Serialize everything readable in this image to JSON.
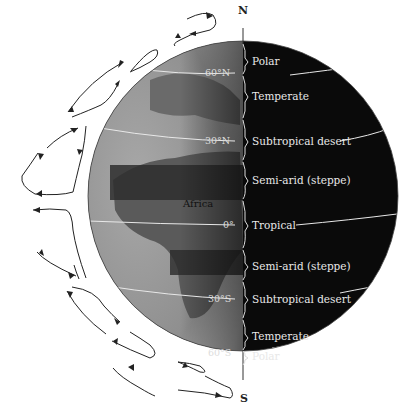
{
  "figure": {
    "poles": {
      "north": "N",
      "south": "S"
    },
    "continent_label": "Africa",
    "latitudes": [
      {
        "label": "60°N",
        "y": 73
      },
      {
        "label": "30°N",
        "y": 141
      },
      {
        "label": "0°",
        "y": 225
      },
      {
        "label": "30°S",
        "y": 299
      },
      {
        "label": "60°S",
        "y": 353
      }
    ],
    "zones": [
      {
        "label": "Polar",
        "y": 61
      },
      {
        "label": "Temperate",
        "y": 96
      },
      {
        "label": "Subtropical desert",
        "y": 141
      },
      {
        "label": "Semi-arid (steppe)",
        "y": 180
      },
      {
        "label": "Tropical",
        "y": 225
      },
      {
        "label": "Semi-arid (steppe)",
        "y": 266
      },
      {
        "label": "Subtropical desert",
        "y": 299
      },
      {
        "label": "Temperate",
        "y": 337
      },
      {
        "label": "Polar",
        "y": 357
      }
    ],
    "colors": {
      "dark_side": "#0a0a0a",
      "lit_side": "#8c8c8c",
      "text_light": "#e8e8e8",
      "arrows": "#222222"
    }
  }
}
